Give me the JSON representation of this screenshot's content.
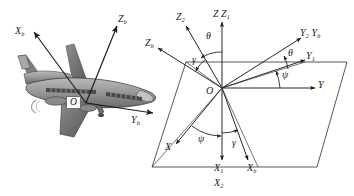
{
  "figure": {
    "background_color": "#ffffff",
    "line_color": "#1a1a1a",
    "plane_fill": "#ffffff",
    "aircraft_body_color": "#8c8c8c",
    "aircraft_shade_color": "#5a5a5a"
  },
  "aircraft_panel": {
    "name": "aircraft-body-axes",
    "origin_label": "O",
    "axes": [
      {
        "key": "xb",
        "label": "X",
        "sub": "b",
        "direction": "up-left"
      },
      {
        "key": "zb",
        "label": "Z",
        "sub": "b",
        "direction": "up-right"
      },
      {
        "key": "yb",
        "label": "Y",
        "sub": "b",
        "direction": "right"
      }
    ]
  },
  "euler_panel": {
    "name": "euler-angle-diagram",
    "origin_label": "O",
    "ground_plane_name": "horizontal-reference-plane",
    "axes": [
      {
        "key": "z2",
        "label": "Z",
        "sub": "2",
        "direction": "up-left"
      },
      {
        "key": "z_z1",
        "label": "Z Z",
        "sub": "1",
        "direction": "up"
      },
      {
        "key": "y2_yb",
        "label": "Y₂ Y",
        "sub": "b",
        "direction": "up-right"
      },
      {
        "key": "y1",
        "label": "Y",
        "sub": "1",
        "direction": "right-up"
      },
      {
        "key": "y",
        "label": "Y",
        "sub": "",
        "direction": "right"
      },
      {
        "key": "zb",
        "label": "Z",
        "sub": "b",
        "direction": "left-up"
      },
      {
        "key": "x",
        "label": "X",
        "sub": "",
        "direction": "down-left"
      },
      {
        "key": "x1",
        "label": "X",
        "sub": "1",
        "direction": "down"
      },
      {
        "key": "x2",
        "label": "X",
        "sub": "2",
        "direction": "down"
      },
      {
        "key": "xb",
        "label": "X",
        "sub": "b",
        "direction": "down-right"
      }
    ],
    "angles": [
      {
        "key": "theta_top",
        "symbol": "θ",
        "name": "pitch-angle-theta-upper"
      },
      {
        "key": "gamma_top",
        "symbol": "γ",
        "name": "roll-angle-gamma-upper"
      },
      {
        "key": "theta_right",
        "symbol": "θ",
        "name": "pitch-angle-theta-right"
      },
      {
        "key": "psi_right",
        "symbol": "ψ",
        "name": "yaw-angle-psi-right"
      },
      {
        "key": "psi_lower",
        "symbol": "ψ",
        "name": "yaw-angle-psi-lower"
      },
      {
        "key": "gamma_lower",
        "symbol": "γ",
        "name": "roll-angle-gamma-lower"
      }
    ]
  }
}
